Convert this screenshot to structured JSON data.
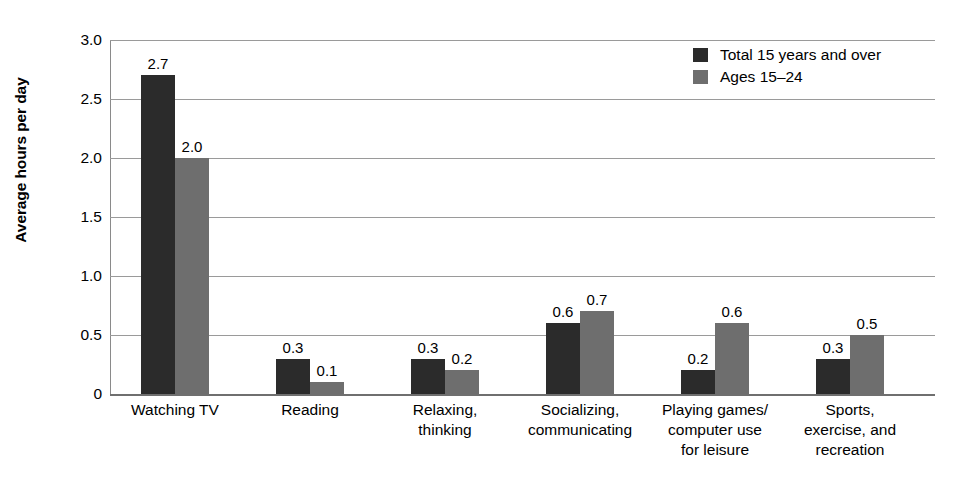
{
  "chart_data": {
    "type": "bar",
    "title": "",
    "xlabel": "",
    "ylabel": "Average hours per day",
    "ylim": [
      0,
      3.0
    ],
    "grid": true,
    "legend_position": "top-right",
    "y_ticks": [
      "0",
      "0.5",
      "1.0",
      "1.5",
      "2.0",
      "2.5",
      "3.0"
    ],
    "y_tick_values": [
      0,
      0.5,
      1.0,
      1.5,
      2.0,
      2.5,
      3.0
    ],
    "categories": [
      "Watching TV",
      "Reading",
      "Relaxing,\nthinking",
      "Socializing,\ncommunicating",
      "Playing games/\ncomputer use\nfor leisure",
      "Sports,\nexercise, and\nrecreation"
    ],
    "series": [
      {
        "name": "Total 15 years and over",
        "color": "#2b2b2b",
        "values": [
          2.7,
          0.3,
          0.3,
          0.6,
          0.2,
          0.3
        ],
        "labels": [
          "2.7",
          "0.3",
          "0.3",
          "0.6",
          "0.2",
          "0.3"
        ]
      },
      {
        "name": "Ages 15–24",
        "color": "#6e6e6e",
        "values": [
          2.0,
          0.1,
          0.2,
          0.7,
          0.6,
          0.5
        ],
        "labels": [
          "2.0",
          "0.1",
          "0.2",
          "0.7",
          "0.6",
          "0.5"
        ]
      }
    ]
  },
  "colors": {
    "series_0": "#2b2b2b",
    "series_1": "#6e6e6e",
    "gridline": "#9a9a9a",
    "axis": "#6f6f6f",
    "background": "#ffffff",
    "text": "#000000"
  }
}
